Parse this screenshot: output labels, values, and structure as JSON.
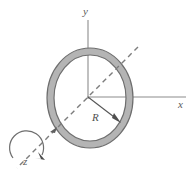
{
  "figure": {
    "type": "engineering-diagram",
    "width": 195,
    "height": 174,
    "background_color": "#ffffff"
  },
  "axes": {
    "y_label": "y",
    "x_label": "x",
    "z_label": "z",
    "origin": {
      "x": 88,
      "y": 97
    },
    "y_axis": {
      "from": {
        "x": 88,
        "y": 20
      },
      "to": {
        "x": 88,
        "y": 97
      },
      "style": "solid",
      "color": "#8c8c8c"
    },
    "x_axis": {
      "from": {
        "x": 88,
        "y": 97
      },
      "to": {
        "x": 186,
        "y": 97
      },
      "style": "solid",
      "color": "#8c8c8c"
    },
    "z_axis": {
      "from": {
        "x": 138,
        "y": 47
      },
      "to": {
        "x": 17,
        "y": 168
      },
      "style": "dashed",
      "color": "#7d7d7d"
    }
  },
  "ring": {
    "center": {
      "x": 90,
      "y": 98
    },
    "outer_radius_x": 43,
    "outer_radius_y": 50,
    "inner_radius_x": 36,
    "inner_radius_y": 43,
    "fill_color": "#b4b4b4",
    "stroke_color": "#6e6e6e"
  },
  "dimension": {
    "radius_label": "R",
    "arrow_from": {
      "x": 88,
      "y": 97
    },
    "arrow_to": {
      "x": 120,
      "y": 122
    },
    "color": "#555555"
  },
  "rotation_indicator": {
    "description": "curved arrow about z-axis",
    "color": "#6e6e6e",
    "arrowhead_at": {
      "x": 43,
      "y": 158
    }
  }
}
